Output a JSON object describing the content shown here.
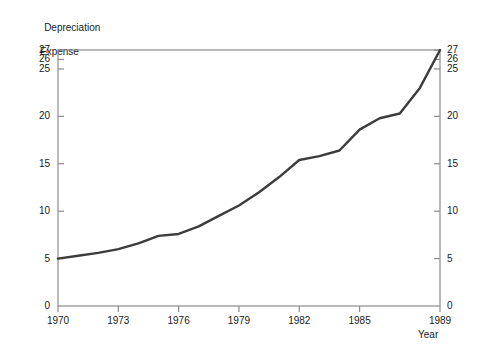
{
  "chart_data": {
    "type": "line",
    "title": "",
    "ylabel_line1": "Depreciation",
    "ylabel_line2": "Expense",
    "xlabel": "Year",
    "xlim": [
      1970,
      1989
    ],
    "ylim": [
      0,
      27
    ],
    "grid": false,
    "legend": "none",
    "line_color": "#3c3c3c",
    "axis_color": "#8c8c8c",
    "text_color": "#1a1a1a",
    "x_tick_labels": [
      "1970",
      "1973",
      "1976",
      "1979",
      "1982",
      "1985",
      "1989"
    ],
    "x_tick_values": [
      1970,
      1973,
      1976,
      1979,
      1982,
      1985,
      1989
    ],
    "y_tick_labels_left": [
      "0",
      "5",
      "10",
      "15",
      "20",
      "25",
      "26",
      "27"
    ],
    "y_tick_values_left": [
      0,
      5,
      10,
      15,
      20,
      25,
      26,
      27
    ],
    "y_tick_labels_right": [
      "0",
      "5",
      "10",
      "15",
      "20",
      "25",
      "26",
      "27"
    ],
    "y_tick_values_right": [
      0,
      5,
      10,
      15,
      20,
      25,
      26,
      27
    ],
    "x": [
      1970,
      1971,
      1972,
      1973,
      1974,
      1975,
      1976,
      1977,
      1978,
      1979,
      1980,
      1981,
      1982,
      1983,
      1984,
      1985,
      1986,
      1987,
      1988,
      1989
    ],
    "values": [
      5.0,
      5.3,
      5.6,
      6.0,
      6.6,
      7.4,
      7.6,
      8.4,
      9.5,
      10.6,
      12.0,
      13.6,
      15.4,
      15.8,
      16.4,
      18.6,
      19.8,
      20.3,
      23.0,
      27.0
    ],
    "series": [
      {
        "name": "Depreciation Expense",
        "values": [
          5.0,
          5.3,
          5.6,
          6.0,
          6.6,
          7.4,
          7.6,
          8.4,
          9.5,
          10.6,
          12.0,
          13.6,
          15.4,
          15.8,
          16.4,
          18.6,
          19.8,
          20.3,
          23.0,
          27.0
        ]
      }
    ]
  }
}
